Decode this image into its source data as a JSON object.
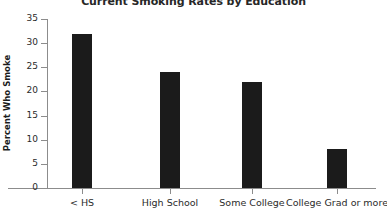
{
  "chart_data": {
    "type": "bar",
    "title": "Current Smoking Rates by Education",
    "xlabel": "",
    "ylabel": "Percent Who Smoke",
    "categories": [
      "< HS",
      "High School",
      "Some College",
      "College Grad or more"
    ],
    "values": [
      32,
      24,
      22,
      8
    ],
    "ylim": [
      0,
      35
    ],
    "yticks": [
      0,
      5,
      10,
      15,
      20,
      25,
      30,
      35
    ],
    "ytick_labels": [
      "0",
      "5",
      "10",
      "15",
      "20",
      "25",
      "30",
      "35"
    ],
    "grid": false,
    "legend": false,
    "bar_color": "#1b1b1b",
    "axis_color": "#8c8c8c",
    "background": "#ffffff"
  }
}
